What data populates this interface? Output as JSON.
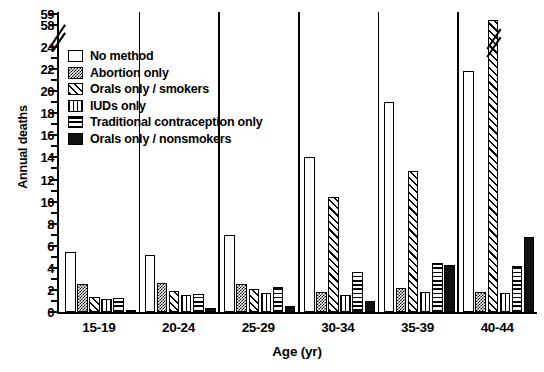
{
  "chart_data": {
    "type": "bar",
    "title": "",
    "xlabel": "Age (yr)",
    "ylabel": "Annual deaths",
    "categories": [
      "15-19",
      "20-24",
      "25-29",
      "30-34",
      "35-39",
      "40-44"
    ],
    "ylim": [
      0,
      24
    ],
    "y_ticks": [
      0,
      2,
      4,
      6,
      8,
      10,
      12,
      14,
      16,
      18,
      20,
      22,
      24
    ],
    "y_ticks_break": [
      58,
      59
    ],
    "axis_break": true,
    "grid": false,
    "legend_position": "upper-left-inside",
    "series": [
      {
        "name": "No method",
        "pattern": "none",
        "values": [
          5.4,
          5.2,
          7.0,
          14.0,
          19.0,
          21.8
        ]
      },
      {
        "name": "Abortion only",
        "pattern": "dots",
        "values": [
          2.5,
          2.6,
          2.5,
          1.8,
          2.2,
          1.8
        ]
      },
      {
        "name": "Orals only / smokers",
        "pattern": "diagonal",
        "values": [
          1.4,
          1.9,
          2.1,
          10.4,
          12.8,
          58.5
        ]
      },
      {
        "name": "IUDs only",
        "pattern": "vertical",
        "values": [
          1.2,
          1.5,
          1.7,
          1.5,
          1.8,
          1.7
        ]
      },
      {
        "name": "Traditional contraception only",
        "pattern": "horizontal",
        "values": [
          1.3,
          1.6,
          2.3,
          3.6,
          4.4,
          4.2
        ]
      },
      {
        "name": "Orals only / nonsmokers",
        "pattern": "solid",
        "values": [
          0.2,
          0.4,
          0.5,
          1.0,
          4.3,
          6.8
        ]
      }
    ]
  },
  "axis": {
    "y_title": "Annual deaths",
    "x_title": "Age (yr)",
    "y_tick_labels": [
      "0",
      "2",
      "4",
      "6",
      "8",
      "10",
      "12",
      "14",
      "16",
      "18",
      "20",
      "22",
      "24"
    ],
    "y_break_labels": [
      "58",
      "59"
    ],
    "x_tick_labels": [
      "15-19",
      "20-24",
      "25-29",
      "30-34",
      "35-39",
      "40-44"
    ]
  },
  "legend": {
    "items": [
      {
        "label": "No method",
        "swatch": "swatch-no-method"
      },
      {
        "label": "Abortion only",
        "swatch": "swatch-abortion-only"
      },
      {
        "label": "Orals only / smokers",
        "swatch": "swatch-orals-smokers"
      },
      {
        "label": "IUDs only",
        "swatch": "swatch-iuds-only"
      },
      {
        "label": "Traditional contraception only",
        "swatch": "swatch-traditional"
      },
      {
        "label": "Orals only / nonsmokers",
        "swatch": "swatch-orals-nonsmokers"
      }
    ]
  },
  "colors": {
    "ink": "#000000",
    "background": "#ffffff",
    "solid_fill": "#111111"
  }
}
